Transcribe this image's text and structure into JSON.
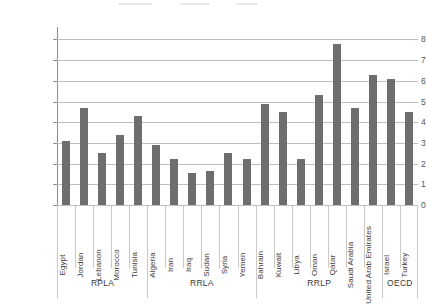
{
  "chart_data": {
    "type": "bar",
    "title": "",
    "subtitle": "",
    "xlabel": "",
    "ylabel": "",
    "ylim": [
      0,
      8.6
    ],
    "yticks": [
      0,
      1,
      2,
      3,
      4,
      5,
      6,
      7,
      8
    ],
    "ytick_labels": [
      "0",
      "1",
      "2",
      "3",
      "4",
      "5",
      "6",
      "7",
      "8"
    ],
    "grid": true,
    "legend": "none",
    "bar_color": "#6e6e6e",
    "categories": [
      "Egypt",
      "Jordan",
      "Lebanon",
      "Morocco",
      "Tunisia",
      "Algeria",
      "Iran",
      "Iraq",
      "Sudan",
      "Syria",
      "Yemen",
      "Bahrain",
      "Kuwait",
      "Libya",
      "Oman",
      "Qatar",
      "Saudi Arabia",
      "United Arab Emirates",
      "Israel",
      "Turkey"
    ],
    "values": [
      3.1,
      4.7,
      2.5,
      3.4,
      4.3,
      2.9,
      2.2,
      1.55,
      1.65,
      2.5,
      2.2,
      4.9,
      4.5,
      2.2,
      5.3,
      7.8,
      4.7,
      6.3,
      6.1,
      4.5
    ],
    "groups": [
      {
        "label": "RPLA",
        "start": 0,
        "count": 5
      },
      {
        "label": "RRLA",
        "start": 5,
        "count": 6
      },
      {
        "label": "RRLP",
        "start": 11,
        "count": 7
      },
      {
        "label": "OECD",
        "start": 18,
        "count": 2
      }
    ]
  }
}
